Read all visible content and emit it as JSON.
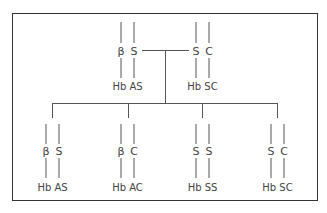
{
  "parents": [
    {
      "alleles": [
        "β",
        "S"
      ],
      "label": "Hb AS"
    },
    {
      "alleles": [
        "S",
        "C"
      ],
      "label": "Hb SC"
    }
  ],
  "children": [
    {
      "alleles": [
        "β",
        "S"
      ],
      "label": "Hb AS"
    },
    {
      "alleles": [
        "β",
        "C"
      ],
      "label": "Hb AC"
    },
    {
      "alleles": [
        "S",
        "S"
      ],
      "label": "Hb SS"
    },
    {
      "alleles": [
        "S",
        "C"
      ],
      "label": "Hb SC"
    }
  ]
}
